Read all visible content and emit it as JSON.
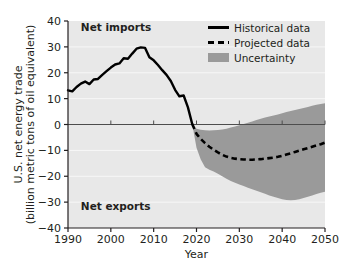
{
  "chart_data": {
    "type": "line",
    "title": "",
    "xlabel": "Year",
    "ylabel": "U.S. net energy trade\n(billion metric tons of oil equivalent)",
    "ylabel_line1": "U.S. net energy trade",
    "ylabel_line2": "(billion metric tons of oil equivalent)",
    "xlim": [
      1990,
      2050
    ],
    "ylim": [
      -40,
      40
    ],
    "xticks": [
      1990,
      2000,
      2010,
      2020,
      2030,
      2040,
      2050
    ],
    "xtick_labels": [
      "1990",
      "2000",
      "2010",
      "2020",
      "2030",
      "2040",
      "2050"
    ],
    "yticks": [
      40,
      30,
      20,
      10,
      0,
      -10,
      -20,
      -30,
      -40
    ],
    "ytick_labels": [
      "40",
      "30",
      "20",
      "10",
      "0",
      "−10",
      "−20",
      "−30",
      "−40"
    ],
    "grid": "horizontal-major-white",
    "zero_line": 0,
    "legend_position": "top-right",
    "annotations": [
      {
        "text": "Net imports",
        "x": 1993,
        "y": 36,
        "bold": true
      },
      {
        "text": "Net exports",
        "x": 1993,
        "y": -33,
        "bold": true
      }
    ],
    "series": [
      {
        "name": "Historical data",
        "style": "solid",
        "color": "#000000",
        "x": [
          1990,
          1991,
          1992,
          1993,
          1994,
          1995,
          1996,
          1997,
          1998,
          1999,
          2000,
          2001,
          2002,
          2003,
          2004,
          2005,
          2006,
          2007,
          2008,
          2009,
          2010,
          2011,
          2012,
          2013,
          2014,
          2015,
          2016,
          2017,
          2018,
          2019
        ],
        "values": [
          13.2,
          12.8,
          14.5,
          15.8,
          16.6,
          15.6,
          17.4,
          17.6,
          19.2,
          20.6,
          22.0,
          23.2,
          23.6,
          25.6,
          25.4,
          27.4,
          29.3,
          29.8,
          29.6,
          26.0,
          24.8,
          23.0,
          21.0,
          19.2,
          16.8,
          13.4,
          10.9,
          11.2,
          6.6,
          0.2
        ]
      },
      {
        "name": "Projected data",
        "style": "dashed",
        "color": "#000000",
        "x": [
          2019,
          2020,
          2021,
          2022,
          2023,
          2024,
          2025,
          2026,
          2027,
          2028,
          2029,
          2030,
          2031,
          2032,
          2033,
          2034,
          2035,
          2036,
          2037,
          2038,
          2039,
          2040,
          2041,
          2042,
          2043,
          2044,
          2045,
          2046,
          2047,
          2048,
          2049,
          2050
        ],
        "values": [
          0.2,
          -3.6,
          -5.6,
          -7.2,
          -8.6,
          -9.8,
          -10.8,
          -11.7,
          -12.4,
          -12.9,
          -13.2,
          -13.4,
          -13.5,
          -13.6,
          -13.6,
          -13.5,
          -13.4,
          -13.2,
          -13.0,
          -12.8,
          -12.5,
          -12.1,
          -11.6,
          -11.1,
          -10.6,
          -10.1,
          -9.6,
          -9.1,
          -8.6,
          -8.1,
          -7.6,
          -7.0
        ]
      }
    ],
    "uncertainty": {
      "name": "Uncertainty",
      "color": "#9a9a9a",
      "x": [
        2019,
        2020,
        2021,
        2022,
        2023,
        2024,
        2025,
        2026,
        2027,
        2028,
        2029,
        2030,
        2031,
        2032,
        2033,
        2034,
        2035,
        2036,
        2037,
        2038,
        2039,
        2040,
        2041,
        2042,
        2043,
        2044,
        2045,
        2046,
        2047,
        2048,
        2049,
        2050
      ],
      "upper": [
        0.2,
        -1.6,
        -2.0,
        -2.2,
        -2.3,
        -2.2,
        -2.1,
        -1.9,
        -1.6,
        -1.2,
        -0.8,
        -0.3,
        0.2,
        0.7,
        1.2,
        1.7,
        2.2,
        2.7,
        3.1,
        3.5,
        3.9,
        4.3,
        4.8,
        5.2,
        5.6,
        6.0,
        6.4,
        6.8,
        7.2,
        7.6,
        7.9,
        8.2
      ],
      "lower": [
        0.2,
        -9.0,
        -13.5,
        -16.5,
        -17.5,
        -18.2,
        -19.0,
        -20.0,
        -21.0,
        -21.8,
        -22.5,
        -23.2,
        -23.8,
        -24.4,
        -25.0,
        -25.6,
        -26.2,
        -26.8,
        -27.4,
        -27.9,
        -28.4,
        -28.9,
        -29.2,
        -29.3,
        -29.2,
        -28.9,
        -28.4,
        -27.9,
        -27.4,
        -26.9,
        -26.4,
        -26.0
      ]
    },
    "legend": [
      {
        "label": "Historical data",
        "marker": "solid-line",
        "color": "#000000"
      },
      {
        "label": "Projected data",
        "marker": "dashed-line",
        "color": "#000000"
      },
      {
        "label": "Uncertainty",
        "marker": "filled-swatch",
        "color": "#9a9a9a"
      }
    ],
    "colors": {
      "plot_background": "#e8e8e8",
      "page_background": "#ffffff",
      "line": "#000000",
      "uncertainty_fill": "#9a9a9a",
      "gridline": "#f7f7f7",
      "axis": "#231f20"
    }
  }
}
